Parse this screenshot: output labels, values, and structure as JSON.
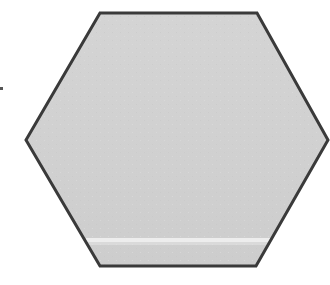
{
  "diagram": {
    "shape": "hexagon",
    "vertices": [
      [
        100,
        13
      ],
      [
        257,
        13
      ],
      [
        328,
        140
      ],
      [
        256,
        266
      ],
      [
        100,
        266
      ],
      [
        26,
        140
      ]
    ],
    "fill_color": "#d1d1d1",
    "fill_light_color": "#dcdcdc",
    "stroke_color": "#3a3a3a",
    "stroke_width": 3,
    "highlight_streak": {
      "y": 240,
      "x_start": 86,
      "x_end": 270,
      "color": "#f2f2f2"
    },
    "side_mark": {
      "x": 0,
      "y": 87,
      "width": 3,
      "height": 3,
      "color": "#555555"
    }
  }
}
